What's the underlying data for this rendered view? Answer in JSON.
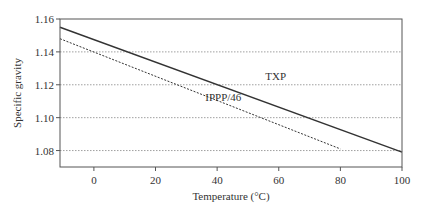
{
  "chart_data": {
    "type": "line",
    "title": "",
    "xlabel": "Temperature (°C)",
    "ylabel": "Specific gravity",
    "xlim": [
      -11,
      100
    ],
    "ylim": [
      1.07,
      1.16
    ],
    "xticks": [
      0,
      20,
      40,
      60,
      80,
      100
    ],
    "xtick_labels": [
      "0",
      "20",
      "40",
      "60",
      "80",
      "100"
    ],
    "yticks": [
      1.08,
      1.1,
      1.12,
      1.14,
      1.16
    ],
    "ytick_labels": [
      "1.08",
      "1.10",
      "1.12",
      "1.14",
      "1.16"
    ],
    "grid": "horizontal dotted at y ticks",
    "legend": "none (inline labels)",
    "series": [
      {
        "name": "TXP",
        "style": "solid",
        "x": [
          -11,
          100
        ],
        "y": [
          1.155,
          1.079
        ]
      },
      {
        "name": "IPPP/46",
        "style": "dashed",
        "x": [
          -11,
          80
        ],
        "y": [
          1.148,
          1.081
        ]
      }
    ],
    "annotations": [
      {
        "text": "TXP",
        "x": 59,
        "y": 1.123
      },
      {
        "text": "IPPP/46",
        "x": 42,
        "y": 1.11
      }
    ]
  },
  "colors": {
    "axis": "#555555",
    "grid": "#888888",
    "line": "#333333",
    "text": "#333333"
  }
}
